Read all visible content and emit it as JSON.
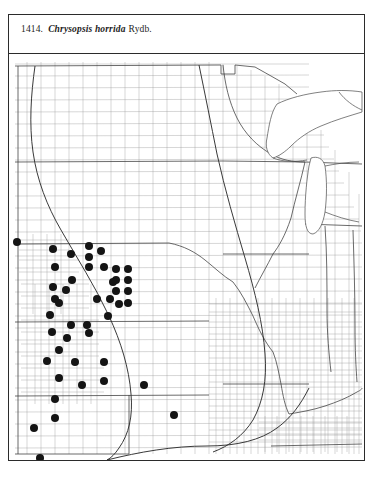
{
  "plate": {
    "number": "1414.",
    "species": "Chrysopsis horrida",
    "authority": "Rydb.",
    "full_caption": "1414. Chrysopsis horrida Rydb."
  },
  "colors": {
    "page_background": "#ffffff",
    "frame_border": "#2b2b2b",
    "county_line": "#9a9a9a",
    "state_line": "#3a3a3a",
    "range_line": "#2e2e2e",
    "dot_fill": "#141414",
    "caption_text": "#1d1d1d"
  },
  "map": {
    "type": "county-dot-distribution-map",
    "region": "central and midwestern United States",
    "dot_symbol": "filled-circle",
    "dot_diameter_px": 8,
    "dot_count": 45,
    "has_range_boundary_curve": true,
    "has_county_lines": true,
    "has_state_lines": true,
    "viewport": {
      "width": 355,
      "height": 406
    }
  },
  "chart_data": {
    "type": "scatter",
    "xlabel": "",
    "ylabel": "",
    "xlim": [
      0,
      355
    ],
    "ylim": [
      0,
      406
    ],
    "grid": false,
    "legend": "none",
    "series": [
      {
        "name": "Collection records",
        "symbol": "filled-circle",
        "color": "#141414",
        "points": [
          [
            8,
            188
          ],
          [
            44,
            195
          ],
          [
            46,
            213
          ],
          [
            62,
            200
          ],
          [
            80,
            192
          ],
          [
            80,
            203
          ],
          [
            80,
            213
          ],
          [
            95,
            213
          ],
          [
            44,
            233
          ],
          [
            63,
            226
          ],
          [
            107,
            215
          ],
          [
            119,
            215
          ],
          [
            107,
            226
          ],
          [
            119,
            226
          ],
          [
            104,
            228
          ],
          [
            107,
            237
          ],
          [
            119,
            237
          ],
          [
            46,
            245
          ],
          [
            50,
            249
          ],
          [
            88,
            245
          ],
          [
            101,
            245
          ],
          [
            41,
            261
          ],
          [
            62,
            271
          ],
          [
            78,
            271
          ],
          [
            99,
            262
          ],
          [
            43,
            278
          ],
          [
            58,
            284
          ],
          [
            50,
            296
          ],
          [
            38,
            307
          ],
          [
            66,
            308
          ],
          [
            95,
            308
          ],
          [
            50,
            324
          ],
          [
            73,
            331
          ],
          [
            95,
            327
          ],
          [
            135,
            331
          ],
          [
            46,
            345
          ],
          [
            46,
            364
          ],
          [
            25,
            374
          ],
          [
            165,
            361
          ],
          [
            31,
            404
          ],
          [
            80,
            279
          ],
          [
            119,
            249
          ],
          [
            92,
            197
          ],
          [
            57,
            236
          ],
          [
            110,
            250
          ]
        ]
      }
    ]
  }
}
